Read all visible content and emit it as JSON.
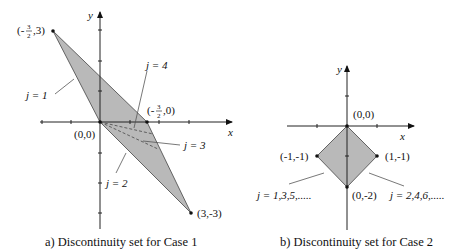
{
  "panel_a": {
    "caption": "a) Discontinuity set for Case 1",
    "axis_x": "x",
    "axis_y": "y",
    "points": {
      "top": "(-3/2,3)",
      "top_frac_num": "3",
      "top_frac_den": "2",
      "top_prefix": "(-",
      "top_suffix": ",3)",
      "mid": "(-3/2,0)",
      "mid_prefix": "(-",
      "mid_frac_num": "3",
      "mid_frac_den": "2",
      "mid_suffix": ",0)",
      "origin": "(0,0)",
      "bottom": "(3,-3)"
    },
    "labels": {
      "j1": "j = 1",
      "j2": "j = 2",
      "j3": "j = 3",
      "j4": "j = 4"
    },
    "fill_color": "#b9b9b9"
  },
  "panel_b": {
    "caption": "b) Discontinuity set for Case 2",
    "axis_x": "x",
    "axis_y": "y",
    "points": {
      "origin": "(0,0)",
      "left": "(-1,-1)",
      "right": "(1,-1)",
      "bottom": "(0,-2)"
    },
    "labels": {
      "odd": "j = 1,3,5,.....",
      "even": "j = 2,4,6,....."
    },
    "fill_color": "#b9b9b9"
  }
}
